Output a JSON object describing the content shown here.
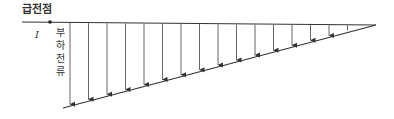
{
  "diagram": {
    "title": "급전점",
    "current_symbol": "I",
    "vertical_label_chars": [
      "부",
      "하",
      "전",
      "류"
    ],
    "vertical_label": "부하전류",
    "colors": {
      "line": "#333333",
      "arrow": "#555555"
    },
    "feed_line": {
      "x1": 22,
      "y1": 22,
      "x2": 376,
      "y2": 25
    },
    "feed_point_dot": {
      "x": 50,
      "y": 22
    },
    "load_line": {
      "x1": 63,
      "y1": 108,
      "x2": 376,
      "y2": 25
    },
    "arrow_count": 16,
    "arrow_x_positions": [
      70,
      88.5,
      107,
      125.5,
      144,
      162.5,
      181,
      199.5,
      218,
      236.5,
      255,
      273.5,
      292,
      310.5,
      329,
      347.5
    ]
  }
}
